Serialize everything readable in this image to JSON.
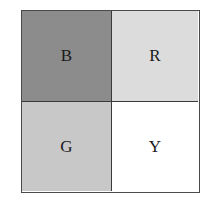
{
  "diagram": {
    "cells": [
      {
        "label": "B",
        "fill": "#8c8c8c",
        "position": "top-left"
      },
      {
        "label": "R",
        "fill": "#dcdcdc",
        "position": "top-right"
      },
      {
        "label": "G",
        "fill": "#c8c8c8",
        "position": "bottom-left"
      },
      {
        "label": "Y",
        "fill": "#ffffff",
        "position": "bottom-right"
      }
    ]
  }
}
